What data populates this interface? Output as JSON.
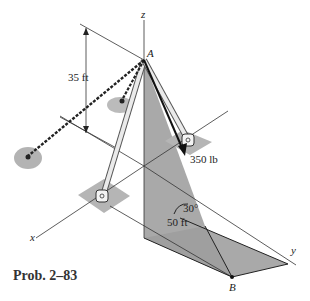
{
  "figure": {
    "caption": "Prob. 2–83",
    "axes": {
      "x": "x",
      "y": "y",
      "z": "z"
    },
    "points": {
      "A": "A",
      "B": "B"
    },
    "dimensions": {
      "height": "35 ft",
      "length": "50 ft",
      "angle": "30°"
    },
    "force": {
      "label": "350 lb"
    },
    "colors": {
      "shade": "#a9a9a9",
      "line": "#222222",
      "rod": "#e6e6e6"
    }
  }
}
